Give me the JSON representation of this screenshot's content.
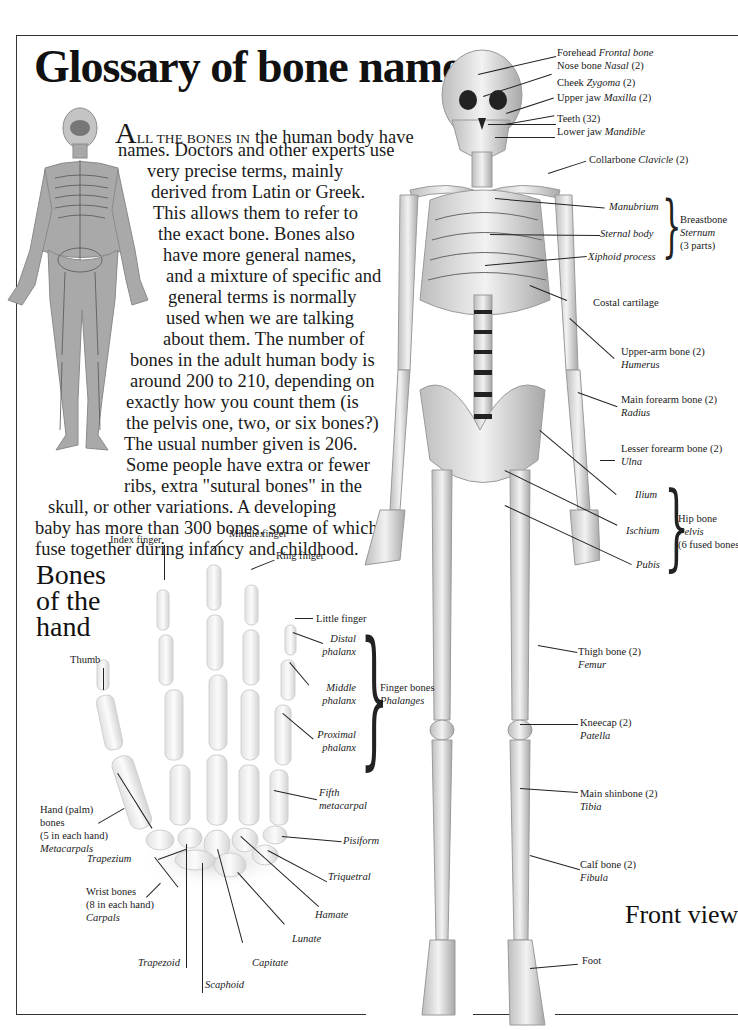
{
  "page": {
    "title": "Glossary of bone names",
    "front_view_label": "Front view"
  },
  "intro": {
    "dropcap": "A",
    "smallcaps": "LL THE BONES IN",
    "lines": [
      " the human body have",
      "names. Doctors and other experts use",
      "very precise terms, mainly",
      "derived from Latin or Greek.",
      "This allows them to refer to",
      "the exact bone. Bones also",
      "have more general names,",
      "and a mixture of specific and",
      "general terms is normally",
      "used when we are talking",
      "about them. The number of",
      "bones in the adult human body is",
      "around 200 to 210, depending on",
      "exactly how you count them (is",
      "the pelvis one, two, or six bones?)",
      "The usual number given is 206.",
      "Some people have extra or fewer",
      "ribs, extra \"sutural bones\" in the",
      "skull, or other variations. A developing",
      "baby has more than 300 bones, some of which",
      "fuse together during infancy and childhood."
    ]
  },
  "skeleton_labels": {
    "forehead": {
      "common": "Forehead",
      "latin": "Frontal bone"
    },
    "nose": {
      "common": "Nose bone",
      "latin": "Nasal",
      "count": "(2)"
    },
    "cheek": {
      "common": "Cheek",
      "latin": "Zygoma",
      "count": "(2)"
    },
    "upper_jaw": {
      "common": "Upper jaw",
      "latin": "Maxilla",
      "count": "(2)"
    },
    "teeth": {
      "common": "Teeth",
      "count": "(32)"
    },
    "lower_jaw": {
      "common": "Lower jaw",
      "latin": "Mandible"
    },
    "collarbone": {
      "common": "Collarbone",
      "latin": "Clavicle",
      "count": "(2)"
    },
    "manubrium": "Manubrium",
    "sternal_body": "Sternal body",
    "xiphoid": "Xiphoid process",
    "breastbone": {
      "common": "Breastbone",
      "latin": "Sternum",
      "note": "(3 parts)"
    },
    "costal": "Costal cartilage",
    "humerus": {
      "common": "Upper-arm bone (2)",
      "latin": "Humerus"
    },
    "radius": {
      "common": "Main forearm bone (2)",
      "latin": "Radius"
    },
    "ulna": {
      "common": "Lesser forearm bone (2)",
      "latin": "Ulna"
    },
    "ilium": "Ilium",
    "ischium": "Ischium",
    "pubis": "Pubis",
    "hip": {
      "common": "Hip bone",
      "latin": "Pelvis",
      "note": "(6 fused bones)"
    },
    "femur": {
      "common": "Thigh bone (2)",
      "latin": "Femur"
    },
    "patella": {
      "common": "Kneecap (2)",
      "latin": "Patella"
    },
    "tibia": {
      "common": "Main shinbone (2)",
      "latin": "Tibia"
    },
    "fibula": {
      "common": "Calf bone (2)",
      "latin": "Fibula"
    },
    "foot": "Foot"
  },
  "hand": {
    "title_lines": [
      "Bones",
      "of the",
      "hand"
    ],
    "index_finger": "Index finger",
    "middle_finger": "Middle finger",
    "ring_finger": "Ring finger",
    "little_finger": "Little finger",
    "thumb": "Thumb",
    "distal": [
      "Distal",
      "phalanx"
    ],
    "middle": [
      "Middle",
      "phalanx"
    ],
    "proximal": [
      "Proximal",
      "phalanx"
    ],
    "finger_bones": {
      "common": "Finger bones",
      "latin": "Phalanges"
    },
    "metacarpals": {
      "lines": [
        "Hand (palm)",
        "bones",
        "(5 in each hand)"
      ],
      "latin": "Metacarpals"
    },
    "fifth_metacarpal": [
      "Fifth",
      "metacarpal"
    ],
    "pisiform": "Pisiform",
    "triquetral": "Triquetral",
    "hamate": "Hamate",
    "lunate": "Lunate",
    "capitate": "Capitate",
    "scaphoid": "Scaphoid",
    "trapezoid": "Trapezoid",
    "trapezium": "Trapezium",
    "carpals": {
      "lines": [
        "Wrist bones",
        "(8 in each hand)"
      ],
      "latin": "Carpals"
    }
  }
}
